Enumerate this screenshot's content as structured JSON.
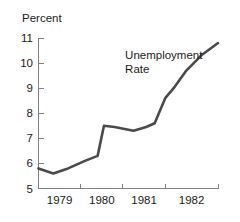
{
  "chart_data": {
    "type": "line",
    "title": "",
    "ylabel": "Percent",
    "xlabel": "",
    "ylim": [
      5,
      11
    ],
    "yticks": [
      5,
      6,
      7,
      8,
      9,
      10,
      11
    ],
    "ytick_labels": [
      "5",
      "6",
      "7",
      "8",
      "9",
      "10",
      "11"
    ],
    "xlim": [
      1978.5,
      1982.75
    ],
    "xticks": [
      1978.5,
      1979.5,
      1980.5,
      1981.5,
      1982.75
    ],
    "xtick_labels": [
      "1979",
      "1980",
      "1981",
      "1982"
    ],
    "grid": false,
    "legend": "none",
    "annotations": [
      {
        "name": "series-annotation",
        "lines": [
          "Unemployment",
          "Rate"
        ],
        "x": 1980.55,
        "y": 10.15
      }
    ],
    "series": [
      {
        "name": "Unemployment Rate",
        "color": "#4a4a4a",
        "x": [
          1978.5,
          1978.85,
          1979.2,
          1979.6,
          1979.9,
          1980.05,
          1980.3,
          1980.75,
          1981.05,
          1981.25,
          1981.5,
          1981.7,
          1982.0,
          1982.35,
          1982.75
        ],
        "values": [
          5.8,
          5.6,
          5.8,
          6.1,
          6.3,
          7.5,
          7.45,
          7.3,
          7.45,
          7.6,
          8.6,
          9.0,
          9.7,
          10.3,
          10.8
        ]
      }
    ]
  },
  "colors": {
    "line": "#4a4a4a",
    "axis": "#808080",
    "text": "#1a1a1a",
    "background": "#ffffff"
  }
}
